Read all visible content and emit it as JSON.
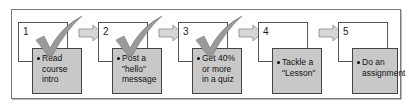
{
  "diagram": {
    "type": "process-flow",
    "steps": [
      {
        "number": "1",
        "text": "Read course intro",
        "lines": [
          "Read",
          "course",
          "intro"
        ],
        "completed": true
      },
      {
        "number": "2",
        "text": "Post a \"hello\" message",
        "lines": [
          "Post a",
          "\"hello\"",
          "message"
        ],
        "completed": true
      },
      {
        "number": "3",
        "text": "Get 40% or more in a quiz",
        "lines": [
          "Get 40%",
          "or more",
          "in a quiz"
        ],
        "completed": true
      },
      {
        "number": "4",
        "text": "Tackle a \"Lesson\"",
        "lines": [
          "Tackle a",
          "\"Lesson\""
        ],
        "completed": false
      },
      {
        "number": "5",
        "text": "Do an assignment",
        "lines": [
          "Do an",
          "assignment"
        ],
        "completed": false
      }
    ],
    "colors": {
      "card": "#c8c8c8",
      "check": "#9a9a9a",
      "arrow": "#d6d6d6",
      "border": "#555555"
    }
  }
}
